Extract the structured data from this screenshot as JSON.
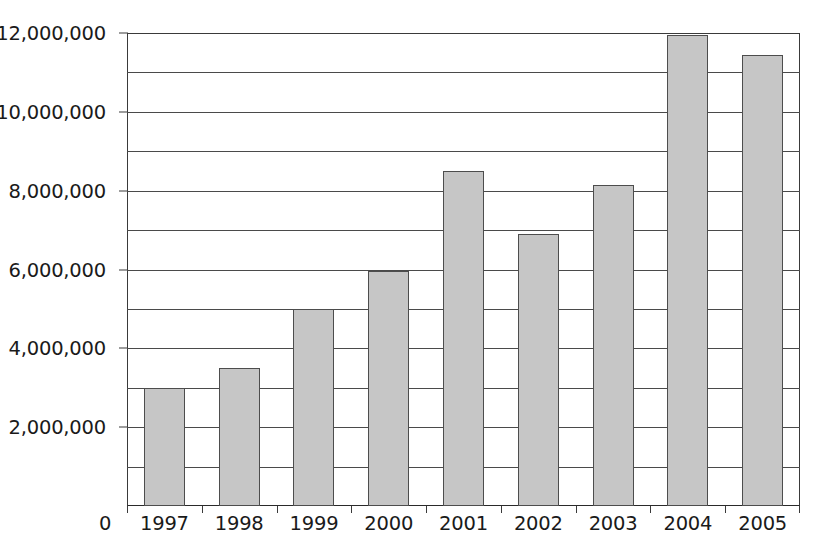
{
  "chart_data": {
    "type": "bar",
    "title": "",
    "subtitle": "",
    "xlabel": "",
    "ylabel": "",
    "categories": [
      "1997",
      "1998",
      "1999",
      "2000",
      "2001",
      "2002",
      "2003",
      "2004",
      "2005"
    ],
    "values": [
      3000000,
      3500000,
      5000000,
      5950000,
      8500000,
      6900000,
      8150000,
      11950000,
      11450000
    ],
    "series": [
      {
        "name": "",
        "values": [
          3000000,
          3500000,
          5000000,
          5950000,
          8500000,
          6900000,
          8150000,
          11950000,
          11450000
        ]
      }
    ],
    "ylim": [
      0,
      12000000
    ],
    "y_tick_values": [
      0,
      2000000,
      4000000,
      6000000,
      8000000,
      10000000,
      12000000
    ],
    "y_tick_labels": [
      "0",
      "2,000,000",
      "4,000,000",
      "6,000,000",
      "8,000,000",
      "10,000,000",
      "12,000,000"
    ],
    "gridline_values": [
      1000000,
      2000000,
      3000000,
      4000000,
      5000000,
      6000000,
      7000000,
      8000000,
      9000000,
      10000000,
      11000000,
      12000000
    ],
    "grid": true,
    "grid_orientation": "horizontal",
    "legend": false,
    "legend_position": "none",
    "annotations": [],
    "colors": {
      "bar_fill": "#c6c6c6",
      "bar_stroke": "#4d4d4d",
      "grid": "#4a4a4a",
      "axis": "#3a3a3a",
      "text": "#1a1a1a",
      "background": "#ffffff"
    }
  },
  "axes": {
    "origin_label": "0"
  }
}
